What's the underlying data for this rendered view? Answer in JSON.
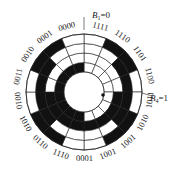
{
  "diagram": {
    "type": "gray-code-encoder-disc",
    "center": [
      84,
      92
    ],
    "rings": 4,
    "sectors": 16,
    "colors": {
      "dark": "#111111",
      "light": "#ffffff",
      "line": "#222222"
    },
    "axis_labels": {
      "top": {
        "var": "B",
        "sub": "1",
        "rest": "=0"
      },
      "right": {
        "var": "B",
        "sub": "4",
        "rest": "=1"
      }
    },
    "sector_codes": [
      "1111",
      "1110",
      "1101",
      "1100",
      "1011",
      "1010",
      "1001",
      "1000",
      "0001",
      "1110",
      "0110",
      "1010",
      "0010",
      "0011",
      "0010",
      "0001",
      "0000"
    ],
    "visible_codes_clockwise_from_top": [
      "1111",
      "1110",
      "1101",
      "1100",
      "1011",
      "1010",
      "1001",
      "1001",
      "0001",
      "1110",
      "0110",
      "1010",
      "0010",
      "0011",
      "0010",
      "0001",
      "0000"
    ],
    "reading_point": "dot"
  }
}
